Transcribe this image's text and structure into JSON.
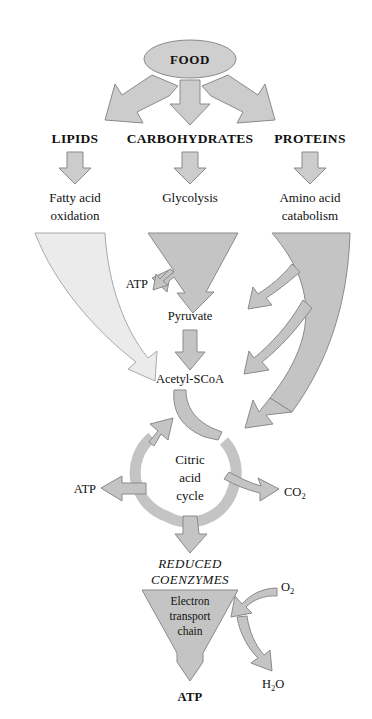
{
  "figure": {
    "background_color": "#ffffff"
  },
  "colors": {
    "fill_light": "#e6e6e6",
    "fill_mid": "#c9c9c9",
    "fill_dark": "#bdbdbd",
    "outline": "#8a8a8a",
    "text": "#111111"
  },
  "nodes": {
    "food": "FOOD",
    "lipids": "LIPIDS",
    "carbohydrates": "CARBOHYDRATES",
    "proteins": "PROTEINS",
    "fatty_acid_line1": "Fatty acid",
    "fatty_acid_line2": "oxidation",
    "glycolysis": "Glycolysis",
    "amino_acid_line1": "Amino acid",
    "amino_acid_line2": "catabolism",
    "atp_glycolysis": "ATP",
    "pyruvate": "Pyruvate",
    "acetyl_scoa": "Acetyl-SCoA",
    "citric_line1": "Citric",
    "citric_line2": "acid",
    "citric_line3": "cycle",
    "atp_cycle": "ATP",
    "co2": "CO",
    "co2_sub": "2",
    "reduced_line1": "REDUCED",
    "reduced_line2": "COENZYMES",
    "etc_line1": "Electron",
    "etc_line2": "transport",
    "etc_line3": "chain",
    "o2": "O",
    "o2_sub": "2",
    "h2o_h": "H",
    "h2o_sub": "2",
    "h2o_o": "O",
    "atp_final": "ATP"
  },
  "edges": [
    {
      "from": "food",
      "to": "lipids",
      "style": "thick-arrow-left"
    },
    {
      "from": "food",
      "to": "carbohydrates",
      "style": "thick-arrow-down"
    },
    {
      "from": "food",
      "to": "proteins",
      "style": "thick-arrow-right"
    },
    {
      "from": "lipids",
      "to": "fatty_acid_oxidation",
      "style": "arrow-down"
    },
    {
      "from": "carbohydrates",
      "to": "glycolysis",
      "style": "arrow-down"
    },
    {
      "from": "proteins",
      "to": "amino_acid_catabolism",
      "style": "arrow-down"
    },
    {
      "from": "fatty_acid_oxidation",
      "to": "acetyl_scoa",
      "style": "curved-band"
    },
    {
      "from": "glycolysis",
      "to": "atp_glycolysis",
      "style": "branch-arrow"
    },
    {
      "from": "glycolysis",
      "to": "pyruvate",
      "style": "funnel"
    },
    {
      "from": "pyruvate",
      "to": "acetyl_scoa",
      "style": "arrow-down"
    },
    {
      "from": "amino_acid_catabolism",
      "to": "pyruvate",
      "style": "branch-arrow"
    },
    {
      "from": "amino_acid_catabolism",
      "to": "acetyl_scoa",
      "style": "branch-arrow"
    },
    {
      "from": "amino_acid_catabolism",
      "to": "citric_acid_cycle",
      "style": "curved-band"
    },
    {
      "from": "acetyl_scoa",
      "to": "citric_acid_cycle",
      "style": "curved-band"
    },
    {
      "from": "citric_acid_cycle",
      "to": "atp_cycle",
      "style": "arrow-left"
    },
    {
      "from": "citric_acid_cycle",
      "to": "co2",
      "style": "arrow-right"
    },
    {
      "from": "citric_acid_cycle",
      "to": "reduced_coenzymes",
      "style": "arrow-down"
    },
    {
      "from": "reduced_coenzymes",
      "to": "electron_transport_chain",
      "style": "funnel"
    },
    {
      "from": "o2",
      "to": "electron_transport_chain",
      "style": "curved-arrow-in"
    },
    {
      "from": "electron_transport_chain",
      "to": "h2o",
      "style": "curved-arrow-out"
    },
    {
      "from": "electron_transport_chain",
      "to": "atp_final",
      "style": "arrow-down"
    }
  ]
}
